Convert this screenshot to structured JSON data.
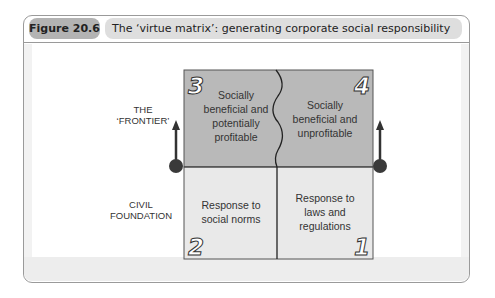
{
  "figure": {
    "number_label": "Figure 20.6",
    "title": "The ‘virtue matrix’: generating corporate social responsibility"
  },
  "side_labels": {
    "top_line1": "THE",
    "top_line2": "‘FRONTIER’",
    "bottom_line1": "CIVIL",
    "bottom_line2": "FOUNDATION"
  },
  "cells": [
    {
      "number": "3",
      "lines": [
        "Socially",
        "beneficial and",
        "potentially",
        "profitable"
      ],
      "position": "top-left",
      "fill": "#b9b9b9"
    },
    {
      "number": "4",
      "lines": [
        "Socially",
        "beneficial and",
        "unprofitable"
      ],
      "position": "top-right",
      "fill": "#b9b9b9"
    },
    {
      "number": "2",
      "lines": [
        "Response to",
        "social norms"
      ],
      "position": "bottom-left",
      "fill": "#e9e9e9"
    },
    {
      "number": "1",
      "lines": [
        "Response to",
        "laws and",
        "regulations"
      ],
      "position": "bottom-right",
      "fill": "#e9e9e9"
    }
  ],
  "colors": {
    "frame": "#9a9a9a",
    "figure_pill": "#b3b3b3",
    "title_pill": "#dedede",
    "top_cells": "#b9b9b9",
    "bottom_cells": "#e9e9e9",
    "arrow": "#333333"
  },
  "icons": {
    "left_marker": "arrow-up-with-dot-icon",
    "right_marker": "arrow-up-with-dot-icon"
  }
}
